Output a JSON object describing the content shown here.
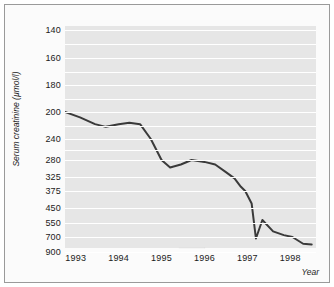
{
  "chart_data": {
    "type": "line",
    "title": "",
    "xlabel": "Year",
    "ylabel": "Serum creatinine (µmol/l)",
    "y_axis_scale": "reciprocal",
    "y_axis_inverted": true,
    "y_ticks": [
      140,
      160,
      180,
      200,
      240,
      280,
      325,
      375,
      450,
      550,
      700,
      900
    ],
    "y_tick_labels": [
      "140",
      "160",
      "180",
      "200",
      "240",
      "280",
      "325",
      "375",
      "450",
      "550",
      "700",
      "900"
    ],
    "x_ticks": [
      1993,
      1994,
      1995,
      1996,
      1997,
      1998
    ],
    "x_tick_labels": [
      "1993",
      "1994",
      "1995",
      "1996",
      "1997",
      "1998"
    ],
    "xlim": [
      1992.75,
      1998.6
    ],
    "ylim": [
      140,
      900
    ],
    "grid": "horizontal-white-lines",
    "legend": "none",
    "line_color": "#3a3a3a",
    "plot_background": "#e6e6e6",
    "series": [
      {
        "name": "Serum creatinine",
        "x": [
          1992.75,
          1993.1,
          1993.45,
          1993.7,
          1994.0,
          1994.25,
          1994.5,
          1994.75,
          1995.0,
          1995.2,
          1995.45,
          1995.7,
          1996.0,
          1996.25,
          1996.5,
          1996.7,
          1996.85,
          1996.95,
          1997.1,
          1997.2,
          1997.35,
          1997.6,
          1997.85,
          1998.05,
          1998.3,
          1998.5
        ],
        "y": [
          200,
          208,
          218,
          222,
          218,
          216,
          218,
          240,
          280,
          300,
          292,
          280,
          285,
          292,
          312,
          330,
          360,
          375,
          430,
          720,
          530,
          640,
          680,
          700,
          790,
          800
        ]
      }
    ]
  },
  "axis": {
    "x_arrow": true,
    "x_title": "Year",
    "y_title": "Serum creatinine (µmol/l)"
  }
}
